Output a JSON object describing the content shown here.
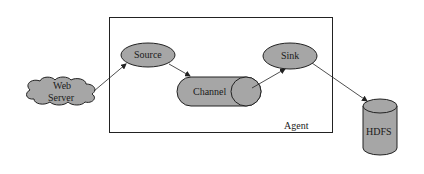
{
  "diagram": {
    "agent_label": "Agent",
    "nodes": {
      "web_server": {
        "line1": "Web",
        "line2": "Server",
        "shape": "cloud"
      },
      "source": {
        "label": "Source",
        "shape": "ellipse"
      },
      "channel": {
        "label": "Channel",
        "shape": "horizontal-cylinder"
      },
      "sink": {
        "label": "Sink",
        "shape": "ellipse"
      },
      "hdfs": {
        "label": "HDFS",
        "shape": "vertical-cylinder"
      }
    },
    "edges": [
      {
        "from": "Web Server",
        "to": "Source"
      },
      {
        "from": "Source",
        "to": "Channel"
      },
      {
        "from": "Channel",
        "to": "Sink"
      },
      {
        "from": "Sink",
        "to": "HDFS"
      }
    ],
    "colors": {
      "fill": "#a6a6a6",
      "stroke": "#222222",
      "background": "#ffffff"
    }
  }
}
